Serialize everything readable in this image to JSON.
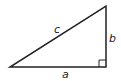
{
  "diagram": {
    "type": "right-triangle",
    "colors": {
      "stroke": "#222222",
      "background": "#ffffff"
    },
    "labels": {
      "hypotenuse": "c",
      "vertical_leg": "b",
      "horizontal_leg": "a"
    },
    "right_angle_marker": true
  }
}
